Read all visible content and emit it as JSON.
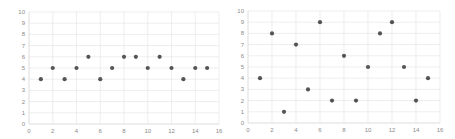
{
  "chart_data": [
    {
      "type": "scatter",
      "title": "",
      "xlabel": "",
      "ylabel": "",
      "xlim": [
        0,
        16
      ],
      "ylim": [
        0,
        10
      ],
      "x_ticks": [
        0,
        2,
        4,
        6,
        8,
        10,
        12,
        14,
        16
      ],
      "y_ticks": [
        0,
        1,
        2,
        3,
        4,
        5,
        6,
        7,
        8,
        9,
        10
      ],
      "grid": true,
      "legend": null,
      "marker_color": "#555555",
      "x": [
        1,
        2,
        3,
        4,
        5,
        6,
        7,
        8,
        9,
        10,
        11,
        12,
        13,
        14,
        15
      ],
      "y": [
        4,
        5,
        4,
        5,
        6,
        4,
        5,
        6,
        6,
        5,
        6,
        5,
        4,
        5,
        5
      ]
    },
    {
      "type": "scatter",
      "title": "",
      "xlabel": "",
      "ylabel": "",
      "xlim": [
        0,
        16
      ],
      "ylim": [
        0,
        10
      ],
      "x_ticks": [
        0,
        2,
        4,
        6,
        8,
        10,
        12,
        14,
        16
      ],
      "y_ticks": [
        0,
        1,
        2,
        3,
        4,
        5,
        6,
        7,
        8,
        9,
        10
      ],
      "grid": true,
      "legend": null,
      "marker_color": "#555555",
      "x": [
        1,
        2,
        3,
        4,
        5,
        6,
        7,
        8,
        9,
        10,
        11,
        12,
        13,
        14,
        15
      ],
      "y": [
        4,
        8,
        1,
        7,
        3,
        9,
        2,
        6,
        2,
        5,
        8,
        9,
        5,
        2,
        4
      ]
    }
  ]
}
